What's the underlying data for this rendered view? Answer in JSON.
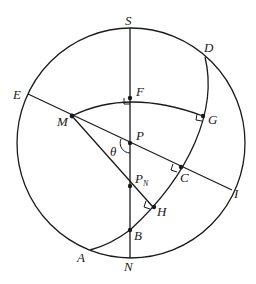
{
  "diagram": {
    "type": "spherical-geometry",
    "colors": {
      "stroke": "#1a1a1a",
      "background": "#ffffff"
    },
    "labels": {
      "S": "S",
      "N": "N",
      "D": "D",
      "E": "E",
      "F": "F",
      "G": "G",
      "M": "M",
      "P": "P",
      "theta": "θ",
      "PN_main": "P",
      "PN_sub": "N",
      "C": "C",
      "H": "H",
      "I": "I",
      "B": "B",
      "A": "A"
    }
  }
}
